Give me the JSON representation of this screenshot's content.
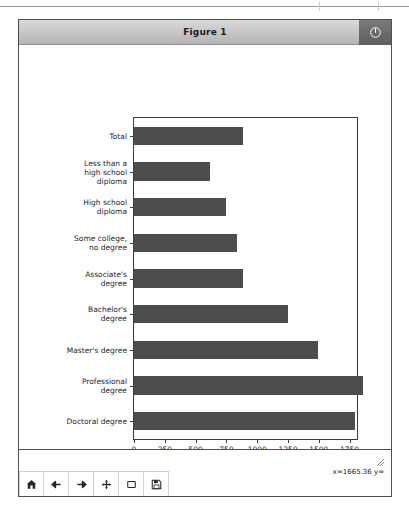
{
  "window": {
    "title": "Figure 1",
    "power_button": "power-icon"
  },
  "toolbar": {
    "buttons": [
      {
        "name": "home-button",
        "icon": "home-icon",
        "tooltip": "Reset original view"
      },
      {
        "name": "back-button",
        "icon": "arrow-left-icon",
        "tooltip": "Back to previous view"
      },
      {
        "name": "forward-button",
        "icon": "arrow-right-icon",
        "tooltip": "Forward to next view"
      },
      {
        "name": "pan-button",
        "icon": "move-arrows-icon",
        "tooltip": "Pan axes with left mouse, zoom with right"
      },
      {
        "name": "zoom-rect-button",
        "icon": "rectangle-icon",
        "tooltip": "Zoom to rectangle"
      },
      {
        "name": "save-button",
        "icon": "floppy-disk-icon",
        "tooltip": "Save the figure"
      }
    ],
    "coordinate_readout": "x=1665.36 y="
  },
  "chart_data": {
    "type": "bar",
    "orientation": "horizontal",
    "title": "",
    "xlabel": "Median weekly earnings (USD)",
    "ylabel": "",
    "categories": [
      "Total",
      "Less than a\nhigh school\ndiploma",
      "High school\ndiploma",
      "Some college,\nno degree",
      "Associate's\ndegree",
      "Bachelor's\ndegree",
      "Master's degree",
      "Professional\ndegree",
      "Doctoral degree"
    ],
    "values": [
      885,
      619,
      746,
      833,
      887,
      1248,
      1497,
      1861,
      1795
    ],
    "bar_color": "#4d4d4d",
    "xlim": [
      0,
      1810
    ],
    "xticks": [
      0,
      250,
      500,
      750,
      1000,
      1250,
      1500,
      1750
    ],
    "xticklabels": [
      "0",
      "250",
      "500",
      "750",
      "1000",
      "1250",
      "1500",
      "1750"
    ],
    "grid": false,
    "legend": null
  }
}
